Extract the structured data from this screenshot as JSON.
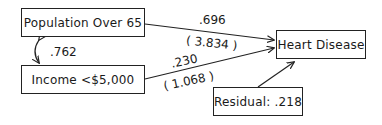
{
  "diagram": {
    "type": "path-diagram",
    "nodes": {
      "pop65": {
        "label": "Population Over 65"
      },
      "income": {
        "label": "Income <$5,000"
      },
      "heart": {
        "label": "Heart Disease"
      },
      "residual": {
        "label": "Residual: .218"
      }
    },
    "edges": {
      "pop65_heart": {
        "coef": ".696",
        "tvalue": "( 3.834 )"
      },
      "income_heart": {
        "coef": ".230",
        "tvalue": "( 1.068 )"
      },
      "pop65_income": {
        "correlation": ".762"
      },
      "residual_heart": {}
    }
  },
  "colors": {
    "stroke": "#222222",
    "text": "#1a1a1a",
    "background": "#ffffff"
  }
}
